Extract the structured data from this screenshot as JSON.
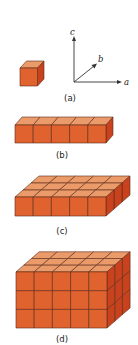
{
  "figure": {
    "colors": {
      "front": "#e0622f",
      "top": "#eb9a6a",
      "side": "#c9421e",
      "edge": "#5a2a18",
      "axis": "#333333"
    },
    "axes": {
      "a_label": "a",
      "b_label": "b",
      "c_label": "c"
    },
    "panels": [
      {
        "id": "a",
        "label": "(a)",
        "nx": 1,
        "ny": 1,
        "nz": 1
      },
      {
        "id": "b",
        "label": "(b)",
        "nx": 5,
        "ny": 1,
        "nz": 1
      },
      {
        "id": "c",
        "label": "(c)",
        "nx": 5,
        "ny": 3,
        "nz": 1
      },
      {
        "id": "d",
        "label": "(d)",
        "nx": 5,
        "ny": 3,
        "nz": 3
      }
    ]
  }
}
